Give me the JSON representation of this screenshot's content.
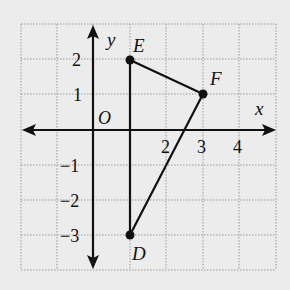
{
  "diagram": {
    "type": "coordinate-plane",
    "axes": {
      "x_label": "x",
      "y_label": "y",
      "origin_label": "O",
      "x_range": [
        -2,
        5
      ],
      "y_range": [
        -4,
        3
      ],
      "x_tick_labels": [
        {
          "value": 2,
          "text": "2"
        },
        {
          "value": 3,
          "text": "3"
        },
        {
          "value": 4,
          "text": "4"
        }
      ],
      "y_tick_labels": [
        {
          "value": 2,
          "text": "2"
        },
        {
          "value": 1,
          "text": "1"
        },
        {
          "value": -1,
          "text": "−1"
        },
        {
          "value": -2,
          "text": "−2"
        },
        {
          "value": -3,
          "text": "−3"
        }
      ]
    },
    "points": [
      {
        "name": "E",
        "x": 1,
        "y": 2
      },
      {
        "name": "F",
        "x": 3,
        "y": 1
      },
      {
        "name": "D",
        "x": 1,
        "y": -3
      }
    ],
    "segments": [
      [
        "E",
        "F"
      ],
      [
        "F",
        "D"
      ],
      [
        "D",
        "E"
      ]
    ],
    "colors": {
      "background": "#ececec",
      "grid": "#9a9a9a",
      "ink": "#111111"
    }
  }
}
